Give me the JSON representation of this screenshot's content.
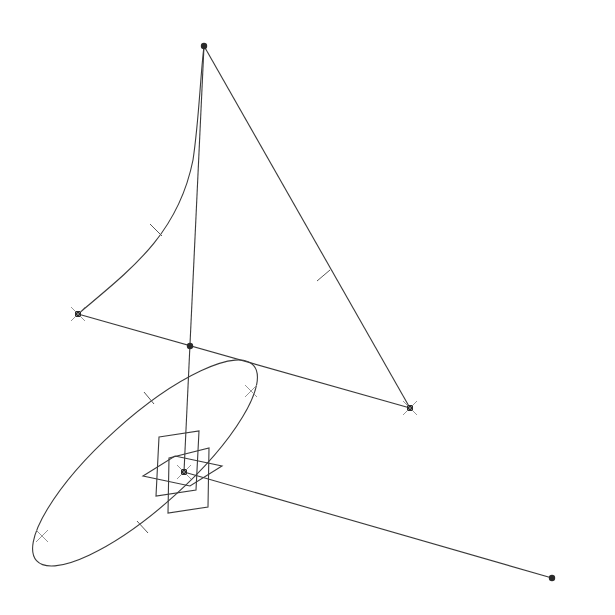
{
  "diagram": {
    "type": "cad-wireframe-sketch",
    "background": "#ffffff",
    "stroke_color": "#3a3a3a",
    "points": {
      "apex": {
        "x": 204,
        "y": 46
      },
      "left_vertex": {
        "x": 78,
        "y": 314
      },
      "right_vertex": {
        "x": 410,
        "y": 408
      },
      "intersection": {
        "x": 190,
        "y": 346
      },
      "origin": {
        "x": 184,
        "y": 472
      },
      "axis_end": {
        "x": 552,
        "y": 578
      }
    },
    "ellipse": {
      "cx": 145,
      "cy": 463,
      "rx": 146,
      "ry": 44,
      "rotation_deg": -42
    },
    "labels": []
  }
}
